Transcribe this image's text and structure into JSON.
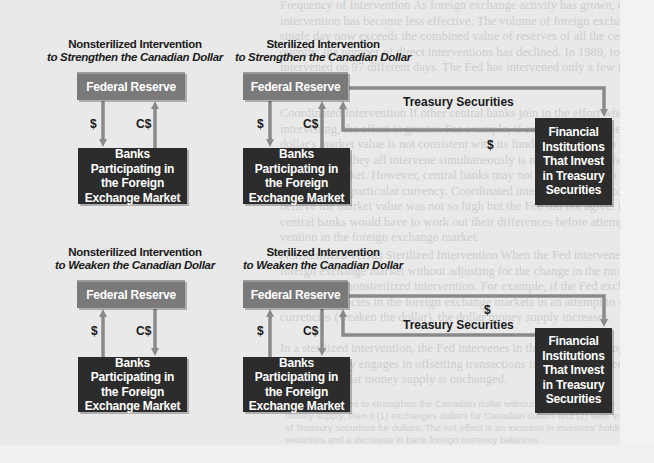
{
  "panels": [
    {
      "id": "nonsterilized-strengthen",
      "title_line1": "Nonsterilized Intervention",
      "title_line2": "to Strengthen the Canadian Dollar",
      "fed_label": "Federal Reserve",
      "banks_label": "Banks Participating in the Foreign Exchange Market",
      "flows": [
        {
          "label": "$",
          "from": "Federal Reserve",
          "to": "Banks Participating in the Foreign Exchange Market"
        },
        {
          "label": "C$",
          "from": "Banks Participating in the Foreign Exchange Market",
          "to": "Federal Reserve"
        }
      ]
    },
    {
      "id": "sterilized-strengthen",
      "title_line1": "Sterilized Intervention",
      "title_line2": "to Strengthen the Canadian Dollar",
      "fed_label": "Federal Reserve",
      "banks_label": "Banks Participating in the Foreign Exchange Market",
      "fi_label": "Financial Institutions That Invest in Treasury Securities",
      "treasury_label": "Treasury Securities",
      "return_label": "$",
      "flows": [
        {
          "label": "$",
          "from": "Federal Reserve",
          "to": "Banks Participating in the Foreign Exchange Market"
        },
        {
          "label": "C$",
          "from": "Banks Participating in the Foreign Exchange Market",
          "to": "Federal Reserve"
        },
        {
          "label": "Treasury Securities",
          "from": "Federal Reserve",
          "to": "Financial Institutions That Invest in Treasury Securities"
        },
        {
          "label": "$",
          "from": "Financial Institutions That Invest in Treasury Securities",
          "to": "Federal Reserve"
        }
      ]
    },
    {
      "id": "nonsterilized-weaken",
      "title_line1": "Nonsterilized Intervention",
      "title_line2": "to Weaken the Canadian Dollar",
      "fed_label": "Federal Reserve",
      "banks_label": "Banks Participating in the Foreign Exchange Market",
      "flows": [
        {
          "label": "$",
          "from": "Banks Participating in the Foreign Exchange Market",
          "to": "Federal Reserve"
        },
        {
          "label": "C$",
          "from": "Federal Reserve",
          "to": "Banks Participating in the Foreign Exchange Market"
        }
      ]
    },
    {
      "id": "sterilized-weaken",
      "title_line1": "Sterilized Intervention",
      "title_line2": "to Weaken the Canadian Dollar",
      "fed_label": "Federal Reserve",
      "banks_label": "Banks Participating in the Foreign Exchange Market",
      "fi_label": "Financial Institutions That Invest in Treasury Securities",
      "treasury_label": "Treasury Securities",
      "return_label": "$",
      "flows": [
        {
          "label": "$",
          "from": "Banks Participating in the Foreign Exchange Market",
          "to": "Federal Reserve"
        },
        {
          "label": "C$",
          "from": "Federal Reserve",
          "to": "Banks Participating in the Foreign Exchange Market"
        },
        {
          "label": "$",
          "from": "Federal Reserve",
          "to": "Financial Institutions That Invest in Treasury Securities"
        },
        {
          "label": "Treasury Securities",
          "from": "Financial Institutions That Invest in Treasury Securities",
          "to": "Federal Reserve"
        }
      ]
    }
  ],
  "labels": {
    "dollar": "$",
    "cad": "C$"
  },
  "colors": {
    "fed_box": "#7a7a7a",
    "dark_box": "#2c2c2c",
    "arrow": "#8a8a8a",
    "background": "#e9e9e9"
  },
  "background_text": [
    "Frequency of Intervention   As foreign exchange activity has grown, central bank",
    "intervention has become less effective. The volume of foreign exchange transactions on a",
    "single day now exceeds the combined value of reserves of all the central banks. Conse-",
    "quently, the number of direct interventions has declined. In 1989, for example, the Fed",
    "intervened on 97 different days. The Fed has intervened only a few times since then.",
    "",
    "Coordinated Intervention   If other central banks join in the effort when",
    "intervening, the effect is greater. For example, if central banks agree that the",
    "dollar's market value is not consistent with its fundamental value, a coordinated interven-",
    "tion in which they all intervene simultaneously is more likely to affect the foreign",
    "exchange market. However, central banks may not agree on how to stabilize or alter",
    "the value of a particular currency. Coordinated intervention may occur when central banks",
    "believe the market value was not so high but the Fed did not agree. In that case, the",
    "central banks would have to work out their differences before attempting direct inter-",
    "vention in the foreign exchange market.",
    "",
    "Nonsterilized versus Sterilized Intervention   When the Fed intervenes in the",
    "foreign exchange market without adjusting for the change in the money supply, it is",
    "engaged in a nonsterilized intervention. For example, if the Fed exchanges dollars for",
    "foreign currencies in the foreign exchange markets in an attempt to strengthen foreign",
    "currencies (weaken the dollar), the dollar money supply increases.",
    "",
    "In a sterilized intervention, the Fed intervenes in the foreign exchange market and",
    "simultaneously engages in offsetting transactions in the Treasury securities markets. As a",
    "result, the dollar money supply is unchanged."
  ],
  "caption_text": [
    "If the Fed desires to strengthen the Canadian dollar without affecting the dollar",
    "money supply, then it (1) exchanges dollars for Canadian dollars and (2) sells some of its holdings",
    "of Treasury securities for dollars. The net effect is an increase in investors' holdings of Treasury",
    "securities and a decrease in bank foreign currency balances."
  ]
}
